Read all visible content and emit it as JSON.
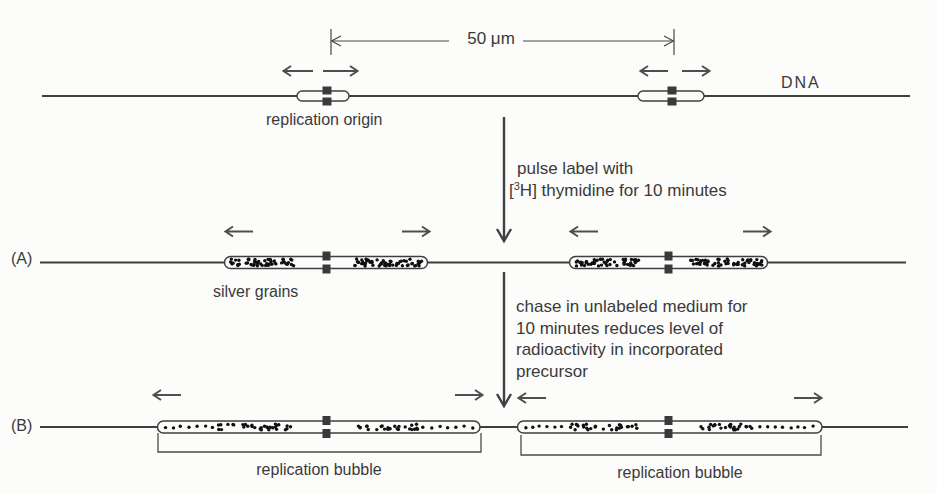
{
  "labels": {
    "scale": "50 μm",
    "dna": "DNA",
    "replication_origin": "replication origin",
    "silver_grains": "silver grains",
    "row_a": "(A)",
    "row_b": "(B)",
    "replication_bubble_left": "replication bubble",
    "replication_bubble_right": "replication bubble"
  },
  "steps": {
    "pulse": {
      "line1": "pulse label with",
      "line2_prefix": "[",
      "line2_sup": "3",
      "line2_suffix": "H] thymidine for 10 minutes"
    },
    "chase": {
      "lines": [
        "chase in unlabeled medium for",
        "10 minutes reduces level of",
        "radioactivity in incorporated",
        "precursor"
      ]
    }
  },
  "palette": {
    "ink": "#3a3a3a",
    "arrow": "#4e4e4e",
    "grain": "#101010",
    "background": "#fcfcfa"
  },
  "grains": {
    "dot_radius": 1.7,
    "clusters": [
      {
        "x0": 230,
        "x1": 294,
        "y0": 258,
        "y1": 267,
        "count": 54,
        "mode": "dense"
      },
      {
        "x0": 352,
        "x1": 425,
        "y0": 258,
        "y1": 267,
        "count": 58,
        "mode": "dense"
      },
      {
        "x0": 576,
        "x1": 640,
        "y0": 258,
        "y1": 267,
        "count": 52,
        "mode": "dense"
      },
      {
        "x0": 690,
        "x1": 763,
        "y0": 258,
        "y1": 267,
        "count": 58,
        "mode": "dense"
      },
      {
        "x0": 165,
        "x1": 213,
        "y0": 423,
        "y1": 431,
        "count": 7,
        "mode": "sparse"
      },
      {
        "x0": 214,
        "x1": 292,
        "y0": 423,
        "y1": 431,
        "count": 32,
        "mode": "dense"
      },
      {
        "x0": 357,
        "x1": 420,
        "y0": 423,
        "y1": 431,
        "count": 26,
        "mode": "dense"
      },
      {
        "x0": 423,
        "x1": 473,
        "y0": 423,
        "y1": 431,
        "count": 7,
        "mode": "sparse"
      },
      {
        "x0": 525,
        "x1": 570,
        "y0": 423,
        "y1": 431,
        "count": 7,
        "mode": "sparse"
      },
      {
        "x0": 572,
        "x1": 637,
        "y0": 423,
        "y1": 431,
        "count": 27,
        "mode": "dense"
      },
      {
        "x0": 700,
        "x1": 758,
        "y0": 423,
        "y1": 431,
        "count": 26,
        "mode": "dense"
      },
      {
        "x0": 760,
        "x1": 813,
        "y0": 423,
        "y1": 431,
        "count": 8,
        "mode": "sparse"
      }
    ]
  }
}
